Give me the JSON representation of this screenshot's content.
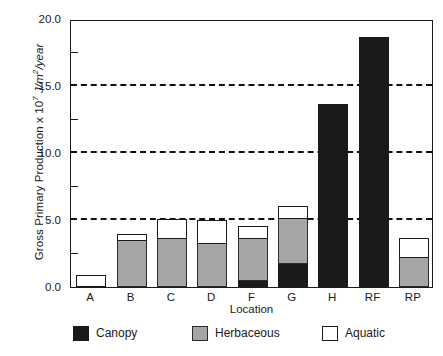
{
  "chart_data": {
    "type": "bar",
    "subtype": "stacked-bar",
    "title": "",
    "xlabel": "Location",
    "ylabel": "Gross Primary Production x 10⁷ J/m²/year",
    "ylabel_parts": {
      "main": "Gross Primary Production  x 10",
      "exponent": "7",
      "units": " J/m",
      "units_exp": "2",
      "units_tail": "/year"
    },
    "categories": [
      "A",
      "B",
      "C",
      "D",
      "F",
      "G",
      "H",
      "RF",
      "RP"
    ],
    "series": [
      {
        "name": "Canopy",
        "color": "#1a1a1a",
        "values": [
          0.0,
          0.0,
          0.0,
          0.0,
          0.45,
          1.7,
          13.55,
          18.6,
          0.0
        ]
      },
      {
        "name": "Herbaceous",
        "color": "#a6a6a6",
        "values": [
          0.0,
          3.45,
          3.6,
          3.2,
          3.1,
          3.4,
          0.0,
          0.0,
          2.2
        ]
      },
      {
        "name": "Aquatic",
        "color": "#ffffff",
        "values": [
          0.8,
          0.4,
          1.4,
          1.75,
          0.95,
          0.9,
          0.0,
          0.0,
          1.4
        ]
      }
    ],
    "totals": [
      0.8,
      3.85,
      5.0,
      4.95,
      4.5,
      6.0,
      13.55,
      18.6,
      3.6
    ],
    "ylim": [
      0.0,
      20.0
    ],
    "ytick_labels": [
      "0.0",
      "5.0",
      "10.0",
      "15.0",
      "20.0"
    ],
    "ytick_values": [
      0.0,
      5.0,
      10.0,
      15.0,
      20.0
    ],
    "yminor_values": [
      2.5,
      7.5,
      12.5,
      17.5
    ],
    "gridlines_at": [
      5.0,
      10.0,
      15.0
    ],
    "grid": "horizontal-dashed",
    "legend_position": "bottom",
    "legend": [
      "Canopy",
      "Herbaceous",
      "Aquatic"
    ]
  }
}
